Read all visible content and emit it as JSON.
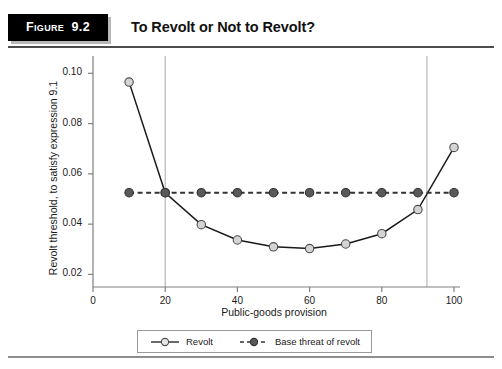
{
  "figure": {
    "tag_word": "Figure",
    "tag_number": "9.2",
    "title": "To Revolt or Not to Revolt?"
  },
  "chart_data": {
    "type": "line",
    "title": "",
    "xlabel": "Public-goods provision",
    "ylabel": "Revolt threshold, to satisfy expression 9.1",
    "x": [
      10,
      20,
      30,
      40,
      50,
      60,
      70,
      80,
      90,
      100
    ],
    "series": [
      {
        "name": "Revolt",
        "style": "solid",
        "marker": "open-circle",
        "color": "#d4d4d4",
        "line_color": "#1a1a1a",
        "values": [
          0.0965,
          0.0525,
          0.0398,
          0.0337,
          0.031,
          0.0303,
          0.0321,
          0.0362,
          0.0458,
          0.0705
        ]
      },
      {
        "name": "Base threat of revolt",
        "style": "dashed",
        "marker": "filled-circle",
        "color": "#595959",
        "line_color": "#333333",
        "values": [
          0.0525,
          0.0525,
          0.0525,
          0.0525,
          0.0525,
          0.0525,
          0.0525,
          0.0525,
          0.0525,
          0.0525
        ]
      }
    ],
    "xlim": [
      0,
      100
    ],
    "ylim": [
      0.015,
      0.1045
    ],
    "xticks": [
      0,
      20,
      40,
      60,
      80,
      100
    ],
    "xtick_labels": [
      "0",
      "20",
      "40",
      "60",
      "80",
      "100"
    ],
    "yticks": [
      0.02,
      0.04,
      0.06,
      0.08,
      0.1
    ],
    "ytick_labels": [
      "0.02",
      "0.04",
      "0.06",
      "0.08",
      "0.10"
    ],
    "grid": false,
    "vertical_reference_lines": [
      20,
      92.5
    ],
    "legend_position": "bottom-center"
  }
}
